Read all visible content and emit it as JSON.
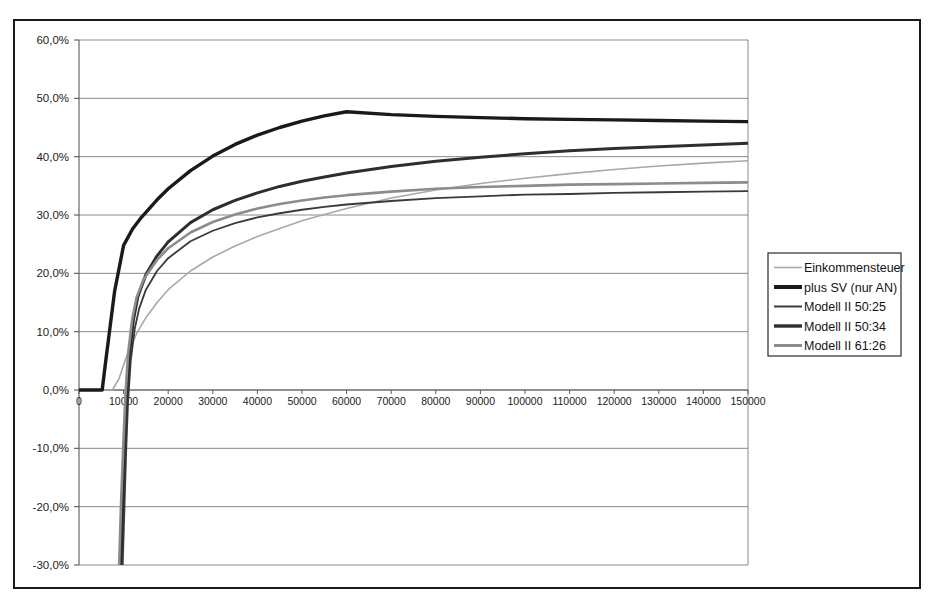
{
  "chart_data": {
    "type": "line",
    "title": "",
    "subtitle": "",
    "xlabel": "",
    "ylabel": "",
    "xlim": [
      0,
      150000
    ],
    "ylim": [
      -30,
      60
    ],
    "grid": true,
    "grid_axis": "y",
    "legend_position": "right-outside",
    "x_ticks": [
      0,
      10000,
      20000,
      30000,
      40000,
      50000,
      60000,
      70000,
      80000,
      90000,
      100000,
      110000,
      120000,
      130000,
      140000,
      150000
    ],
    "x_tick_labels": [
      "0",
      "10000",
      "20000",
      "30000",
      "40000",
      "50000",
      "60000",
      "70000",
      "80000",
      "90000",
      "100000",
      "110000",
      "120000",
      "130000",
      "140000",
      "150000"
    ],
    "y_ticks": [
      60,
      50,
      40,
      30,
      20,
      10,
      0,
      -10,
      -20,
      -30
    ],
    "y_tick_labels": [
      "60,0%",
      "50,0%",
      "40,0%",
      "30,0%",
      "20,0%",
      "10,0%",
      "0,0%",
      "-10,0%",
      "-20,0%",
      "-30,0%"
    ],
    "series": [
      {
        "name": "Einkommensteuer",
        "color": "#a8a8a8",
        "width": 1.6,
        "x": [
          0,
          5000,
          7500,
          9000,
          11000,
          13000,
          15000,
          17500,
          20000,
          25000,
          30000,
          35000,
          40000,
          45000,
          50000,
          55000,
          60000,
          70000,
          80000,
          90000,
          100000,
          110000,
          120000,
          130000,
          140000,
          150000
        ],
        "y": [
          0.0,
          0.0,
          0.0,
          2.0,
          6.5,
          9.8,
          12.4,
          15.0,
          17.2,
          20.4,
          22.8,
          24.7,
          26.3,
          27.7,
          29.0,
          30.1,
          31.1,
          32.9,
          34.3,
          35.4,
          36.3,
          37.1,
          37.8,
          38.4,
          38.9,
          39.3
        ]
      },
      {
        "name": "plus SV (nur AN)",
        "color": "#1a1a1a",
        "width": 3.4,
        "x": [
          0,
          2000,
          4000,
          5200,
          6000,
          8000,
          10000,
          12000,
          14000,
          17500,
          20000,
          25000,
          30000,
          35000,
          40000,
          45000,
          50000,
          55000,
          60000,
          70000,
          80000,
          90000,
          100000,
          110000,
          120000,
          130000,
          140000,
          150000
        ],
        "y": [
          0.0,
          0.0,
          0.0,
          0.0,
          5.0,
          17.0,
          24.8,
          27.6,
          29.6,
          32.6,
          34.5,
          37.6,
          40.1,
          42.1,
          43.7,
          45.0,
          46.1,
          47.0,
          47.7,
          47.2,
          46.9,
          46.7,
          46.5,
          46.4,
          46.3,
          46.2,
          46.1,
          46.0
        ]
      },
      {
        "name": "Modell II 50:25",
        "color": "#3a3a3a",
        "width": 1.8,
        "x": [
          9800,
          10200,
          10600,
          11000,
          11600,
          12500,
          13500,
          15000,
          17500,
          20000,
          25000,
          30000,
          35000,
          40000,
          45000,
          50000,
          55000,
          60000,
          70000,
          80000,
          90000,
          100000,
          110000,
          120000,
          130000,
          140000,
          150000
        ],
        "y": [
          -30.0,
          -20.0,
          -10.0,
          -2.0,
          5.0,
          10.5,
          14.0,
          17.2,
          20.4,
          22.6,
          25.5,
          27.3,
          28.6,
          29.6,
          30.3,
          30.9,
          31.4,
          31.8,
          32.4,
          32.9,
          33.2,
          33.5,
          33.6,
          33.8,
          33.9,
          34.0,
          34.1
        ]
      },
      {
        "name": "Modell II 50:34",
        "color": "#2e2e2e",
        "width": 3.0,
        "x": [
          9400,
          9800,
          10200,
          10700,
          11300,
          12200,
          13200,
          15000,
          17500,
          20000,
          25000,
          30000,
          35000,
          40000,
          45000,
          50000,
          55000,
          60000,
          70000,
          80000,
          90000,
          100000,
          110000,
          120000,
          130000,
          140000,
          150000
        ],
        "y": [
          -30.0,
          -20.0,
          -10.0,
          -1.5,
          6.0,
          12.0,
          16.0,
          19.8,
          23.0,
          25.4,
          28.7,
          30.9,
          32.5,
          33.8,
          34.9,
          35.8,
          36.5,
          37.2,
          38.3,
          39.2,
          39.9,
          40.5,
          41.0,
          41.4,
          41.7,
          42.0,
          42.3
        ]
      },
      {
        "name": "Modell II 61:26",
        "color": "#8c8c8c",
        "width": 2.6,
        "x": [
          9000,
          9400,
          9900,
          10400,
          11000,
          11900,
          12900,
          14500,
          17500,
          20000,
          25000,
          30000,
          35000,
          40000,
          45000,
          50000,
          55000,
          60000,
          70000,
          80000,
          90000,
          100000,
          110000,
          120000,
          130000,
          140000,
          150000
        ],
        "y": [
          -30.0,
          -20.0,
          -10.0,
          -1.0,
          6.2,
          12.0,
          15.8,
          19.0,
          22.3,
          24.3,
          27.0,
          28.8,
          30.1,
          31.1,
          31.9,
          32.5,
          33.0,
          33.4,
          34.0,
          34.5,
          34.8,
          35.0,
          35.2,
          35.3,
          35.4,
          35.5,
          35.6
        ]
      }
    ],
    "legend": {
      "items": [
        {
          "label": "Einkommensteuer",
          "color": "#a8a8a8",
          "width": 1.6
        },
        {
          "label": "plus SV (nur AN)",
          "color": "#1a1a1a",
          "width": 4.0
        },
        {
          "label": "Modell II 50:25",
          "color": "#3a3a3a",
          "width": 2.0
        },
        {
          "label": "Modell II 50:34",
          "color": "#2e2e2e",
          "width": 3.4
        },
        {
          "label": "Modell II 61:26",
          "color": "#8c8c8c",
          "width": 3.0
        }
      ]
    },
    "style": {
      "plot_background": "#ffffff",
      "grid_color": "#7d7d7d",
      "axis_color": "#5a5a5a",
      "frame_color": "#1a1a1a",
      "legend_border": "#2b2b2b"
    }
  }
}
